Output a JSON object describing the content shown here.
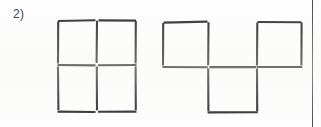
{
  "page": {
    "background_color": "#fdfdfd",
    "ink_color": "#2b2b2f",
    "width": 321,
    "height": 127
  },
  "problem": {
    "number_label": "2)"
  },
  "border": {
    "right_rule_color": "#4a4a4f"
  },
  "figures": [
    {
      "id": "figure-left",
      "name": "two-by-two-square-grid",
      "description": "A 2 by 2 grid of four equal squares drawn with matchsticks",
      "squares": 4,
      "matchsticks": 12,
      "rows": 2,
      "columns": 2
    },
    {
      "id": "figure-right",
      "name": "t-shaped-three-square-figure",
      "description": "Three squares arranged in a T shape: one upper-left square, one upper-right square with a gap between them, and one square below centered between the two",
      "squares": 3,
      "matchsticks": 10,
      "arrangement": "two on top with gap, one centered below"
    }
  ]
}
